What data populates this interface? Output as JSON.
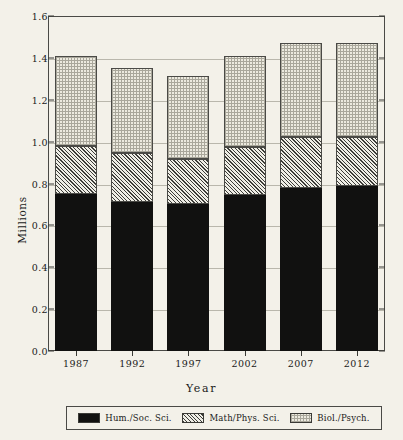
{
  "chart_data": {
    "type": "bar",
    "stacked": true,
    "title": "",
    "xlabel": "Year",
    "ylabel": "Millions",
    "categories": [
      "1987",
      "1992",
      "1997",
      "2002",
      "2007",
      "2012"
    ],
    "ylim": [
      0.0,
      1.6
    ],
    "ytick_labels": [
      "0.0",
      "0.2",
      "0.4",
      "0.6",
      "0.8",
      "1.0",
      "1.2",
      "1.4",
      "1.6"
    ],
    "ytick_values": [
      0.0,
      0.2,
      0.4,
      0.6,
      0.8,
      1.0,
      1.2,
      1.4,
      1.6
    ],
    "grid": true,
    "legend_position": "bottom",
    "series": [
      {
        "name": "Hum./Soc. Sci.",
        "pattern": "solid-black",
        "color": "#111110",
        "values": [
          0.75,
          0.71,
          0.7,
          0.745,
          0.78,
          0.79
        ]
      },
      {
        "name": "Math/Phys. Sci.",
        "pattern": "diagonal-hatch",
        "color": "#3c3c38",
        "values": [
          0.23,
          0.235,
          0.215,
          0.23,
          0.24,
          0.23
        ]
      },
      {
        "name": "Biol./Psych.",
        "pattern": "dotted-light",
        "color": "#eceadf",
        "values": [
          0.43,
          0.405,
          0.4,
          0.435,
          0.45,
          0.45
        ]
      }
    ],
    "totals": [
      1.41,
      1.35,
      1.315,
      1.41,
      1.47,
      1.47
    ]
  },
  "legend": {
    "items": [
      {
        "label": "Hum./Soc. Sci."
      },
      {
        "label": "Math/Phys. Sci."
      },
      {
        "label": "Biol./Psych."
      }
    ]
  }
}
